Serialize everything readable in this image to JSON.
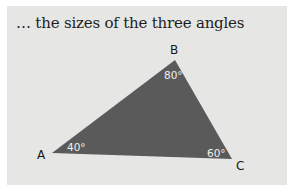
{
  "title": "… the sizes of the three angles",
  "triangle": {
    "fill": "#5a5a5a",
    "vertices": [
      {
        "name": "A",
        "angle": "40°"
      },
      {
        "name": "B",
        "angle": "80°"
      },
      {
        "name": "C",
        "angle": "60°"
      }
    ]
  },
  "colors": {
    "panel_bg": "#e6e6e4",
    "text": "#1e1e1e",
    "angle_text": "#f0f0f0"
  }
}
